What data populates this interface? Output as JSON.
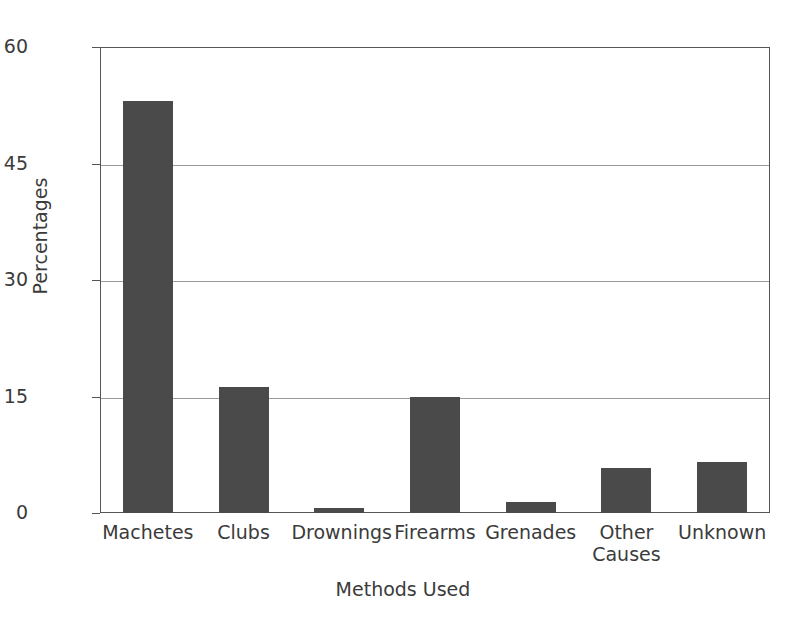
{
  "chart_data": {
    "type": "bar",
    "title": "",
    "xlabel": "Methods Used",
    "ylabel": "Percentages",
    "categories": [
      "Machetes",
      "Clubs",
      "Drownings",
      "Firearms",
      "Grenades",
      "Other Causes",
      "Unknown"
    ],
    "category_lines": [
      [
        "Machetes"
      ],
      [
        "Clubs"
      ],
      [
        "Drownings"
      ],
      [
        "Firearms"
      ],
      [
        "Grenades"
      ],
      [
        "Other",
        "Causes"
      ],
      [
        "Unknown"
      ]
    ],
    "values": [
      53,
      16.2,
      0.7,
      15,
      1.4,
      5.8,
      6.6
    ],
    "ylim": [
      0,
      60
    ],
    "yticks": [
      0,
      15,
      30,
      45,
      60
    ],
    "ytick_labels": [
      "0",
      "15",
      "30",
      "45",
      "60"
    ],
    "gridlines_at": [
      15,
      30,
      45
    ],
    "grid": true,
    "legend": "none",
    "bar_color": "#4a4a4a",
    "grid_color": "#9a9a9a",
    "axis_color": "#555555",
    "text_color": "#3b3b3b",
    "background": "#ffffff"
  }
}
